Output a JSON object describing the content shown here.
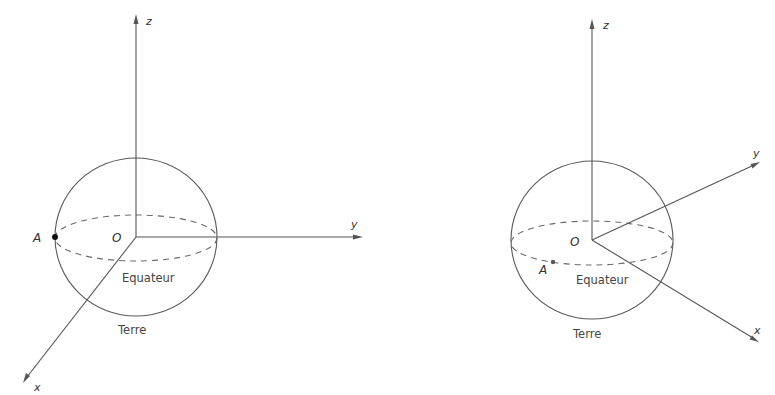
{
  "figures": [
    {
      "id": "left",
      "axes": {
        "x_label": "x",
        "y_label": "y",
        "z_label": "z"
      },
      "origin_label": "O",
      "point_label": "A",
      "equator_label": "Equateur",
      "sphere_label": "Terre"
    },
    {
      "id": "right",
      "axes": {
        "x_label": "x",
        "y_label": "y",
        "z_label": "z"
      },
      "origin_label": "O",
      "point_label": "A",
      "equator_label": "Equateur",
      "sphere_label": "Terre"
    }
  ]
}
